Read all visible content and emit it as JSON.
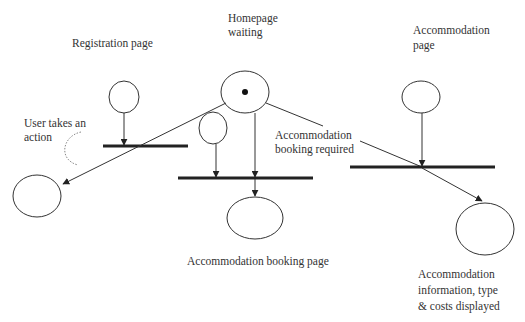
{
  "diagram": {
    "type": "petri-net / activity flow",
    "labels": {
      "registration": "Registration page",
      "homepage_line1": "Homepage",
      "homepage_line2": "waiting",
      "accommodation_page_line1": "Accommodation",
      "accommodation_page_line2": "page",
      "user_action_line1": "User takes an",
      "user_action_line2": "action",
      "booking_required_line1": "Accommodation",
      "booking_required_line2": "booking required",
      "booking_page": "Accommodation booking page",
      "info_line1": "Accommodation",
      "info_line2": "information, type",
      "info_line3": "& costs displayed"
    },
    "nodes": [
      {
        "id": "registration-place",
        "kind": "place"
      },
      {
        "id": "homepage-place",
        "kind": "place",
        "token": true
      },
      {
        "id": "user-action-place",
        "kind": "place"
      },
      {
        "id": "accommodation-page-place",
        "kind": "place"
      },
      {
        "id": "registered-place",
        "kind": "place"
      },
      {
        "id": "booking-page-place",
        "kind": "place"
      },
      {
        "id": "info-displayed-place",
        "kind": "place"
      },
      {
        "id": "registration-transition",
        "kind": "transition"
      },
      {
        "id": "booking-transition",
        "kind": "transition"
      },
      {
        "id": "accommodation-transition",
        "kind": "transition"
      }
    ],
    "colors": {
      "stroke": "#333333",
      "bar": "#222222",
      "dotted_arc": "#888888",
      "text": "#333333"
    }
  }
}
